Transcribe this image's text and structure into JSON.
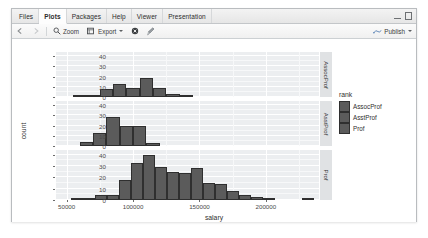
{
  "window": {
    "tabs": [
      {
        "label": "Files",
        "active": false
      },
      {
        "label": "Plots",
        "active": true
      },
      {
        "label": "Packages",
        "active": false
      },
      {
        "label": "Help",
        "active": false
      },
      {
        "label": "Viewer",
        "active": false
      },
      {
        "label": "Presentation",
        "active": false
      }
    ],
    "controls": {
      "minimize": "minimize-icon",
      "maximize": "maximize-icon"
    }
  },
  "toolbar": {
    "back_icon": "back-arrow-icon",
    "forward_icon": "forward-arrow-icon",
    "zoom_label": "Zoom",
    "zoom_icon": "magnifier-icon",
    "export_label": "Export",
    "export_icon": "export-icon",
    "remove_icon": "remove-plot-icon",
    "clear_icon": "clear-all-plots-icon",
    "publish_label": "Publish",
    "publish_icon": "publish-icon"
  },
  "chart_data": {
    "type": "bar",
    "subtype": "faceted-histogram",
    "title": "",
    "xlabel": "salary",
    "ylabel": "count",
    "xlim": [
      42000,
      240000
    ],
    "ylim": [
      0,
      44
    ],
    "xticks": [
      50000,
      100000,
      150000,
      200000
    ],
    "yticks": [
      0,
      10,
      20,
      30,
      40
    ],
    "grid": true,
    "legend": {
      "title": "rank",
      "position": "right",
      "entries": [
        "AssocProf",
        "AsstProf",
        "Prof"
      ]
    },
    "facets": [
      {
        "label": "AssocProf",
        "bin_width": 10000,
        "bins": [
          {
            "x": 60000,
            "count": 1
          },
          {
            "x": 70000,
            "count": 2
          },
          {
            "x": 80000,
            "count": 8
          },
          {
            "x": 90000,
            "count": 13
          },
          {
            "x": 100000,
            "count": 9
          },
          {
            "x": 110000,
            "count": 19
          },
          {
            "x": 120000,
            "count": 9
          },
          {
            "x": 130000,
            "count": 3
          },
          {
            "x": 140000,
            "count": 2
          }
        ]
      },
      {
        "label": "AsstProf",
        "bin_width": 10000,
        "bins": [
          {
            "x": 65000,
            "count": 4
          },
          {
            "x": 75000,
            "count": 13
          },
          {
            "x": 85000,
            "count": 28
          },
          {
            "x": 95000,
            "count": 20
          },
          {
            "x": 105000,
            "count": 20
          },
          {
            "x": 115000,
            "count": 3
          }
        ]
      },
      {
        "label": "Prof",
        "bin_width": 9000,
        "bins": [
          {
            "x": 58000,
            "count": 1
          },
          {
            "x": 67000,
            "count": 1
          },
          {
            "x": 76000,
            "count": 4
          },
          {
            "x": 85000,
            "count": 4
          },
          {
            "x": 94000,
            "count": 18
          },
          {
            "x": 103000,
            "count": 33
          },
          {
            "x": 112000,
            "count": 40
          },
          {
            "x": 121000,
            "count": 29
          },
          {
            "x": 130000,
            "count": 25
          },
          {
            "x": 139000,
            "count": 24
          },
          {
            "x": 148000,
            "count": 28
          },
          {
            "x": 157000,
            "count": 15
          },
          {
            "x": 166000,
            "count": 14
          },
          {
            "x": 175000,
            "count": 8
          },
          {
            "x": 184000,
            "count": 4
          },
          {
            "x": 193000,
            "count": 3
          },
          {
            "x": 202000,
            "count": 1
          },
          {
            "x": 232000,
            "count": 1
          }
        ]
      }
    ]
  }
}
